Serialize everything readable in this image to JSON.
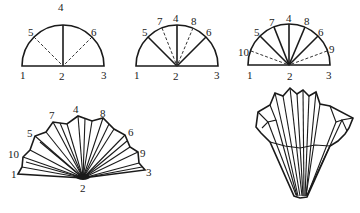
{
  "steps": [
    {
      "id": "step-1",
      "labels": [
        {
          "text": "1",
          "x": 20,
          "y": 79
        },
        {
          "text": "2",
          "x": 59,
          "y": 80
        },
        {
          "text": "3",
          "x": 101,
          "y": 79
        },
        {
          "text": "4",
          "x": 58,
          "y": 11
        },
        {
          "text": "5",
          "x": 28,
          "y": 36
        },
        {
          "text": "6",
          "x": 91,
          "y": 36
        }
      ]
    },
    {
      "id": "step-2",
      "labels": [
        {
          "text": "1",
          "x": 134,
          "y": 79
        },
        {
          "text": "2",
          "x": 173,
          "y": 80
        },
        {
          "text": "3",
          "x": 214,
          "y": 79
        },
        {
          "text": "4",
          "x": 173,
          "y": 22
        },
        {
          "text": "5",
          "x": 142,
          "y": 36
        },
        {
          "text": "6",
          "x": 206,
          "y": 36
        },
        {
          "text": "7",
          "x": 157,
          "y": 25
        },
        {
          "text": "8",
          "x": 191,
          "y": 25
        }
      ]
    },
    {
      "id": "step-3",
      "labels": [
        {
          "text": "1",
          "x": 247,
          "y": 79
        },
        {
          "text": "2",
          "x": 287,
          "y": 80
        },
        {
          "text": "3",
          "x": 326,
          "y": 79
        },
        {
          "text": "4",
          "x": 286,
          "y": 22
        },
        {
          "text": "5",
          "x": 254,
          "y": 36
        },
        {
          "text": "6",
          "x": 318,
          "y": 36
        },
        {
          "text": "7",
          "x": 269,
          "y": 26
        },
        {
          "text": "8",
          "x": 304,
          "y": 25
        },
        {
          "text": "9",
          "x": 329,
          "y": 53
        },
        {
          "text": "10",
          "x": 238,
          "y": 56
        }
      ]
    },
    {
      "id": "step-4-fan",
      "labels": [
        {
          "text": "1",
          "x": 11,
          "y": 178
        },
        {
          "text": "2",
          "x": 80,
          "y": 192
        },
        {
          "text": "3",
          "x": 146,
          "y": 176
        },
        {
          "text": "4",
          "x": 73,
          "y": 113
        },
        {
          "text": "5",
          "x": 27,
          "y": 137
        },
        {
          "text": "6",
          "x": 128,
          "y": 136
        },
        {
          "text": "7",
          "x": 49,
          "y": 119
        },
        {
          "text": "8",
          "x": 100,
          "y": 117
        },
        {
          "text": "9",
          "x": 140,
          "y": 157
        },
        {
          "text": "10",
          "x": 8,
          "y": 158
        }
      ]
    },
    {
      "id": "step-5-filter-cone",
      "labels": []
    }
  ]
}
